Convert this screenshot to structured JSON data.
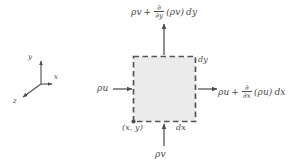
{
  "figure": {
    "background_color": "#ffffff",
    "element": {
      "fill_color": "#ebebeb",
      "border_color": "#555555",
      "border_style": "dashed"
    },
    "arrow_color": "#555555",
    "text_color": "#4a4a4a"
  },
  "labels": {
    "top_flux": {
      "base": "ρv",
      "plus": "+",
      "partial_numerator": "∂",
      "partial_denominator": "∂y",
      "operand": "(ρv)",
      "differential": "dy"
    },
    "right_flux": {
      "base": "ρu",
      "plus": "+",
      "partial_numerator": "∂",
      "partial_denominator": "∂x",
      "operand": "(ρu)",
      "differential": "dx"
    },
    "left_flux": "ρu",
    "bottom_flux": "ρv",
    "width_dimension": "dx",
    "height_dimension": "dy",
    "corner_coordinate": "(x, y)"
  },
  "axes": {
    "y_label": "y",
    "x_label": "x",
    "z_label": "z"
  }
}
